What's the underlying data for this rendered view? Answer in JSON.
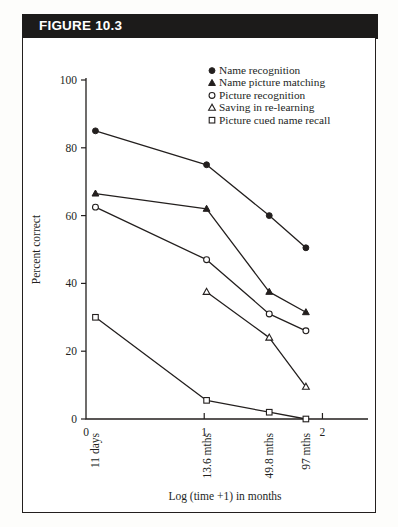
{
  "figure": {
    "label": "FIGURE 10.3"
  },
  "chart_data": {
    "type": "line",
    "title": "",
    "xlabel": "Log (time +1) in months",
    "ylabel": "Percent correct",
    "ylim": [
      0,
      100
    ],
    "yticks": [
      0,
      20,
      40,
      60,
      80,
      100
    ],
    "yticklabels": [
      "0",
      "20",
      "40",
      "60",
      "80",
      "100"
    ],
    "xlim": [
      0,
      2.25
    ],
    "xticks": [
      0,
      1,
      2
    ],
    "xticklabels": [
      "0",
      "1",
      "2"
    ],
    "grid": false,
    "legend_position": "top-right",
    "x": [
      0.08,
      1.02,
      1.55,
      1.86
    ],
    "x_point_labels": [
      "11 days",
      "13.6 mths",
      "49.8 mths",
      "97 mths"
    ],
    "series": [
      {
        "name": "Name recognition",
        "marker": "filled-circle",
        "values": [
          85,
          75,
          60,
          50.5
        ]
      },
      {
        "name": "Name picture matching",
        "marker": "filled-triangle",
        "values": [
          66.5,
          62,
          37.5,
          31.5
        ]
      },
      {
        "name": "Picture recognition",
        "marker": "open-circle",
        "values": [
          62.5,
          47,
          31,
          26
        ]
      },
      {
        "name": "Saving in re-learning",
        "marker": "open-triangle",
        "values": [
          null,
          37.5,
          24,
          9.5
        ]
      },
      {
        "name": "Picture cued name recall",
        "marker": "open-square",
        "values": [
          30,
          5.5,
          2,
          0
        ]
      }
    ]
  },
  "legend": {
    "items": [
      {
        "label": "Name recognition",
        "marker": "filled-circle"
      },
      {
        "label": "Name picture matching",
        "marker": "filled-triangle"
      },
      {
        "label": "Picture recognition",
        "marker": "open-circle"
      },
      {
        "label": "Saving in re-learning",
        "marker": "open-triangle"
      },
      {
        "label": "Picture cued name recall",
        "marker": "open-square"
      }
    ]
  }
}
